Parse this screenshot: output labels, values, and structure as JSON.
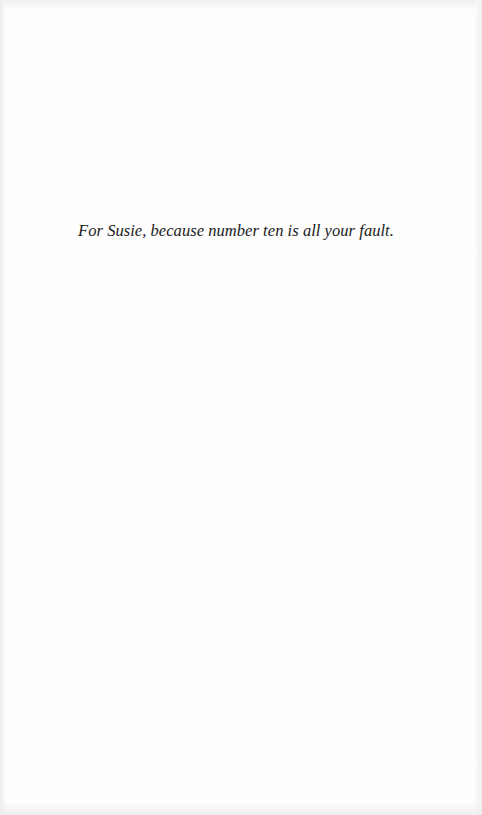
{
  "page": {
    "type": "dedication",
    "text": "For Susie, because number ten is all your fault.",
    "colors": {
      "background": "#fefefe",
      "ink": "#1a1a1a"
    }
  }
}
